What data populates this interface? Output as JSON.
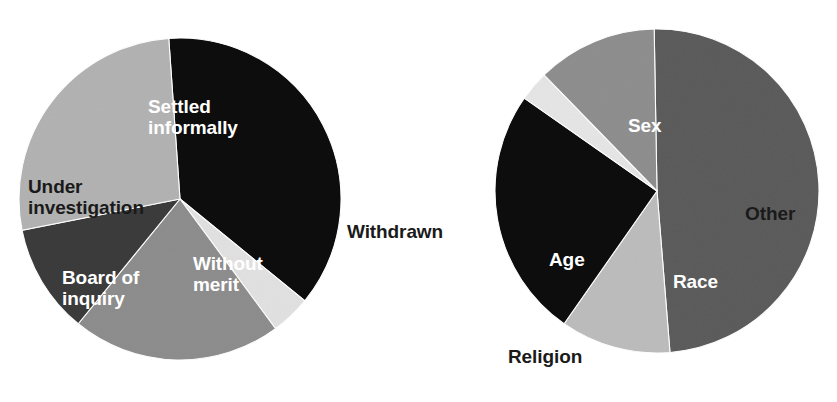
{
  "figure": {
    "background_color": "#ffffff",
    "width": 837,
    "height": 402
  },
  "chart_data": [
    {
      "type": "pie",
      "title": "",
      "name": "complaint-outcomes-pie",
      "center": [
        180,
        199
      ],
      "radius": 161,
      "start_angle_deg": -4,
      "direction": "clockwise",
      "legend": "none",
      "grid": false,
      "categories": [
        "Settled informally",
        "Withdrawn",
        "Without merit",
        "Board of inquiry",
        "Under investigation"
      ],
      "values": [
        37,
        4,
        21,
        11,
        27
      ],
      "colors": [
        "#0b0b0b",
        "#e2e2e2",
        "#8e8e8e",
        "#3b3b3b",
        "#b3b3b3"
      ],
      "label_placement": [
        "inside",
        "outside",
        "inside",
        "inside",
        "inside"
      ],
      "label_text_colors": [
        "#ffffff",
        "#1a1a1a",
        "#ffffff",
        "#ffffff",
        "#1a1a1a"
      ]
    },
    {
      "type": "pie",
      "title": "",
      "name": "complaint-grounds-pie",
      "center": [
        657,
        191
      ],
      "radius": 162,
      "start_angle_deg": -1,
      "direction": "clockwise",
      "legend": "none",
      "grid": false,
      "categories": [
        "Sex",
        "Other",
        "Race",
        "Religion",
        "Age"
      ],
      "values": [
        49,
        11,
        25,
        3,
        12
      ],
      "colors": [
        "#5c5c5c",
        "#bdbdbd",
        "#0b0b0b",
        "#e6e6e6",
        "#8f8f8f"
      ],
      "label_placement": [
        "inside",
        "inside",
        "inside",
        "outside",
        "inside"
      ],
      "label_text_colors": [
        "#ffffff",
        "#1a1a1a",
        "#ffffff",
        "#1a1a1a",
        "#ffffff"
      ]
    }
  ],
  "labels": {
    "left_pie": {
      "settled_informally": "Settled\ninformally",
      "withdrawn": "Withdrawn",
      "without_merit": "Without\nmerit",
      "board_of_inquiry": "Board of\ninquiry",
      "under_investigation": "Under\ninvestigation"
    },
    "right_pie": {
      "sex": "Sex",
      "other": "Other",
      "race": "Race",
      "religion": "Religion",
      "age": "Age"
    }
  }
}
